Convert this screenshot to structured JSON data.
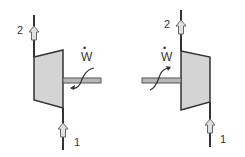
{
  "colors": {
    "line": "#333333",
    "body_fill": "#d4d4d4",
    "shaft_fill": "#b8b8b8",
    "arrow_fill": "#e0e0e0"
  },
  "left_device": {
    "type": "turbine-or-compressor",
    "inlet_label": "1",
    "outlet_label": "2",
    "work_label": "W",
    "work_dot": "•"
  },
  "right_device": {
    "type": "turbine-or-compressor",
    "inlet_label": "1",
    "outlet_label": "2",
    "work_label": "W",
    "work_dot": "•"
  }
}
